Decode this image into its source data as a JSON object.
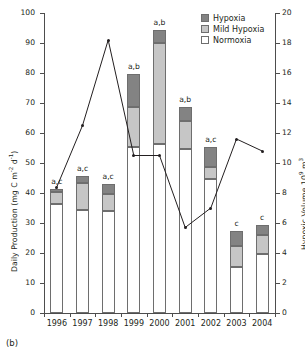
{
  "caption": "(b)",
  "chart_data": {
    "type": "bar",
    "title": "",
    "subtitle": "",
    "categories": [
      "1996",
      "1997",
      "1998",
      "1999",
      "2000",
      "2001",
      "2002",
      "2003",
      "2004"
    ],
    "xlabel": "",
    "ylabel": "Daily Production (mg C m d )",
    "ylabel_parts": {
      "text": "Daily Production (mg C m",
      "sup1": "-2",
      "mid": " d",
      "sup2": "-1",
      "end": ")"
    },
    "ylim": [
      0,
      100
    ],
    "yticks": [
      0,
      10,
      20,
      30,
      40,
      50,
      60,
      70,
      80,
      90,
      100
    ],
    "y2label": "Hypoxic Volume 10 m",
    "y2label_parts": {
      "text": "Hypoxic Volume 10",
      "sup1": "9",
      "mid": " m",
      "sup2": "3"
    },
    "y2lim": [
      0,
      20
    ],
    "y2ticks": [
      0,
      2,
      4,
      6,
      8,
      10,
      12,
      14,
      16,
      18,
      20
    ],
    "grid": false,
    "legend_position": "top-right",
    "series": [
      {
        "name": "Normoxia",
        "type": "bar-segment",
        "color": "#ffffff",
        "values": [
          36.3,
          34.3,
          34.1,
          55.2,
          56.5,
          54.5,
          44.5,
          15.2,
          19.8
        ]
      },
      {
        "name": "Mild Hypoxia",
        "type": "bar-segment",
        "color": "#c6c6c6",
        "values": [
          4.0,
          9.0,
          5.6,
          13.5,
          33.5,
          9.5,
          4.2,
          7.0,
          6.2
        ]
      },
      {
        "name": "Hypoxia",
        "type": "bar-segment",
        "color": "#838383",
        "values": [
          1.2,
          2.5,
          3.2,
          11.0,
          4.5,
          4.7,
          6.6,
          5.1,
          3.3
        ]
      },
      {
        "name": "Total Daily Production",
        "type": "bar-total",
        "values": [
          41.5,
          45.8,
          42.9,
          79.7,
          94.5,
          68.7,
          55.3,
          27.3,
          29.3
        ]
      },
      {
        "name": "Hypoxic Volume",
        "type": "line",
        "axis": "right",
        "color": "#231f20",
        "values": [
          8.4,
          12.5,
          18.2,
          10.5,
          10.5,
          5.7,
          7.0,
          11.6,
          10.8
        ]
      }
    ],
    "annotations": [
      "a,c",
      "a,c",
      "a,c",
      "a,b",
      "a,b",
      "a,b",
      "a,c",
      "c",
      "c"
    ],
    "legend": [
      {
        "label": "Hypoxia",
        "swatch": "sw-hyp"
      },
      {
        "label": "Mild Hypoxia",
        "swatch": "sw-mild"
      },
      {
        "label": "Normoxia",
        "swatch": "sw-norm"
      }
    ]
  }
}
